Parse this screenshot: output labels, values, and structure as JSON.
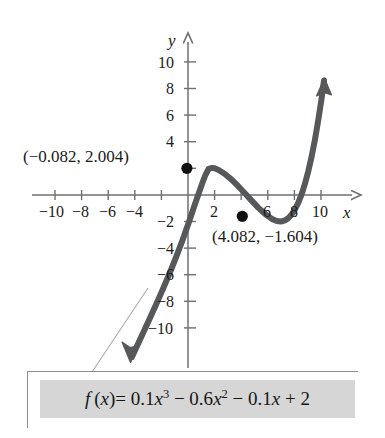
{
  "figure": {
    "axes": {
      "x_axis_label": "x",
      "y_axis_label": "y",
      "x_ticks": [
        -10,
        -8,
        -6,
        -4,
        -2,
        2,
        4,
        6,
        8,
        10
      ],
      "x_tick_labels": [
        "−10",
        "−8",
        "−6",
        "−4",
        "",
        "2",
        "",
        "6",
        "8",
        "10"
      ],
      "y_ticks": [
        10,
        8,
        6,
        4,
        2,
        -2,
        -4,
        -6,
        -8,
        -10
      ],
      "y_tick_labels": [
        "10",
        "8",
        "6",
        "4",
        "",
        "−2",
        "−4",
        "−6",
        "−8",
        "−10"
      ],
      "xlim": [
        -11.5,
        12.5
      ],
      "ylim": [
        -11.5,
        11.5
      ],
      "grid": false
    },
    "annotations": [
      {
        "name": "local-maximum-label",
        "text": "(−0.082, 2.004)",
        "x": -0.082,
        "y": 2.004
      },
      {
        "name": "local-minimum-label",
        "text": "(4.082, −1.604)",
        "x": 4.082,
        "y": -1.604
      }
    ],
    "points": [
      {
        "name": "local-maximum-point",
        "x": -0.082,
        "y": 2.004
      },
      {
        "name": "local-minimum-point",
        "x": 4.082,
        "y": -1.604
      }
    ],
    "equation": {
      "lead": "f",
      "arg": "(x)",
      "equals": "=",
      "terms": [
        "0.1x",
        "3",
        " − 0.6x",
        "2",
        " − 0.1x + 2"
      ],
      "plain": "f(x) = 0.1x³ − 0.6x² − 0.1x + 2"
    },
    "colors": {
      "curve": "#57585a",
      "axis": "#6f7073",
      "text": "#1a1a1a",
      "box_fill": "#d6d6d6",
      "box_border": "#8d8d8d",
      "point": "#111111"
    }
  },
  "chart_data": {
    "type": "line",
    "title": "",
    "xlabel": "x",
    "ylabel": "y",
    "xlim": [
      -11.5,
      12.5
    ],
    "ylim": [
      -11.5,
      11.5
    ],
    "grid": false,
    "legend": "none",
    "function": "f(x) = 0.1x^3 - 0.6x^2 - 0.1x + 2",
    "coefficients": {
      "a": 0.1,
      "b": -0.6,
      "c": -0.1,
      "d": 2
    },
    "x": [
      -4.2,
      -4.0,
      -3.5,
      -3.0,
      -2.5,
      -2.0,
      -1.5,
      -1.0,
      -0.5,
      -0.082,
      0.0,
      0.5,
      1.0,
      1.5,
      2.0,
      2.5,
      3.0,
      3.5,
      4.0,
      4.082,
      4.5,
      5.0,
      5.5,
      6.0,
      6.5,
      7.0,
      7.5,
      7.9
    ],
    "y": [
      -17.9,
      -16.0,
      -11.9,
      -8.5,
      -5.6,
      -3.4,
      -1.7,
      -0.6,
      -0.1,
      2.004,
      2.0,
      1.8,
      1.4,
      0.8,
      0.0,
      -0.9,
      -1.8,
      -2.5,
      -2.8,
      -1.604,
      -2.7,
      -2.0,
      -0.7,
      1.4,
      4.3,
      8.2,
      13.2,
      17.3
    ],
    "annotated_points": [
      {
        "label": "(−0.082, 2.004)",
        "x": -0.082,
        "y": 2.004,
        "kind": "local maximum"
      },
      {
        "label": "(4.082, −1.604)",
        "x": 4.082,
        "y": -1.604,
        "kind": "local minimum"
      }
    ],
    "x_ticks": [
      -10,
      -8,
      -6,
      -4,
      2,
      6,
      8,
      10
    ],
    "y_ticks": [
      10,
      8,
      6,
      4,
      -2,
      -4,
      -6,
      -8,
      -10
    ]
  }
}
